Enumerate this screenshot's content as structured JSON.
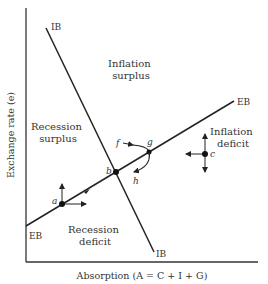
{
  "diagram": {
    "x_axis_label": "Absorption (A = C + I + G)",
    "y_axis_label": "Exchange rate (e)",
    "curves": {
      "ib": {
        "label_top": "IB",
        "label_bottom": "IB"
      },
      "eb": {
        "label_left": "EB",
        "label_right": "EB"
      }
    },
    "regions": {
      "inflation_surplus": [
        "Inflation",
        "surplus"
      ],
      "recession_surplus": [
        "Recession",
        "surplus"
      ],
      "inflation_deficit": [
        "Inflation",
        "deficit"
      ],
      "recession_deficit": [
        "Recession",
        "deficit"
      ]
    },
    "points": {
      "a": "a",
      "b": "b",
      "c": "c",
      "f": "f",
      "g": "g",
      "h": "h"
    },
    "colors": {
      "line": "#222222",
      "text": "#333333",
      "background": "#ffffff"
    }
  }
}
